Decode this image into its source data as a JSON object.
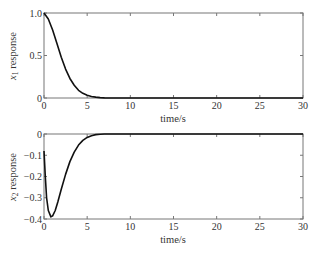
{
  "chart_data": [
    {
      "type": "line",
      "title": "",
      "xlabel": "time/s",
      "ylabel": "x1 response",
      "ylabel_var": "x",
      "ylabel_sub": "1",
      "ylabel_rest": " response",
      "xlim": [
        0,
        30
      ],
      "ylim": [
        0,
        1.0
      ],
      "xticks": [
        "0",
        "5",
        "10",
        "15",
        "20",
        "25",
        "30"
      ],
      "yticks": [
        "0",
        "0.5",
        "1.0"
      ],
      "grid": false,
      "series": [
        {
          "name": "x1",
          "x": [
            0,
            0.5,
            1,
            1.5,
            2,
            2.5,
            3,
            3.5,
            4,
            4.5,
            5,
            5.5,
            6,
            6.5,
            7,
            8,
            10,
            15,
            20,
            25,
            30
          ],
          "y": [
            1.0,
            0.93,
            0.8,
            0.64,
            0.48,
            0.34,
            0.23,
            0.15,
            0.09,
            0.055,
            0.032,
            0.018,
            0.01,
            0.005,
            0.002,
            0.0,
            0.0,
            0.0,
            0.0,
            0.0,
            0.0
          ]
        }
      ]
    },
    {
      "type": "line",
      "title": "",
      "xlabel": "time/s",
      "ylabel": "x2 response",
      "ylabel_var": "x",
      "ylabel_sub": "2",
      "ylabel_rest": " response",
      "xlim": [
        0,
        30
      ],
      "ylim": [
        -0.4,
        0
      ],
      "xticks": [
        "0",
        "5",
        "10",
        "15",
        "20",
        "25",
        "30"
      ],
      "yticks": [
        "0",
        "-0.1",
        "-0.2",
        "-0.3",
        "-0.4"
      ],
      "grid": false,
      "series": [
        {
          "name": "x2",
          "x": [
            0,
            0.15,
            0.3,
            0.5,
            0.8,
            1.0,
            1.3,
            1.6,
            2,
            2.5,
            3,
            3.5,
            4,
            4.5,
            5,
            5.5,
            6,
            6.5,
            7,
            8,
            10,
            15,
            20,
            25,
            30
          ],
          "y": [
            -0.08,
            -0.2,
            -0.3,
            -0.36,
            -0.39,
            -0.385,
            -0.36,
            -0.32,
            -0.26,
            -0.19,
            -0.13,
            -0.085,
            -0.052,
            -0.03,
            -0.016,
            -0.008,
            -0.003,
            -0.001,
            0.0,
            0.0,
            0.0,
            0.0,
            0.0,
            0.0,
            0.0
          ]
        }
      ]
    }
  ]
}
